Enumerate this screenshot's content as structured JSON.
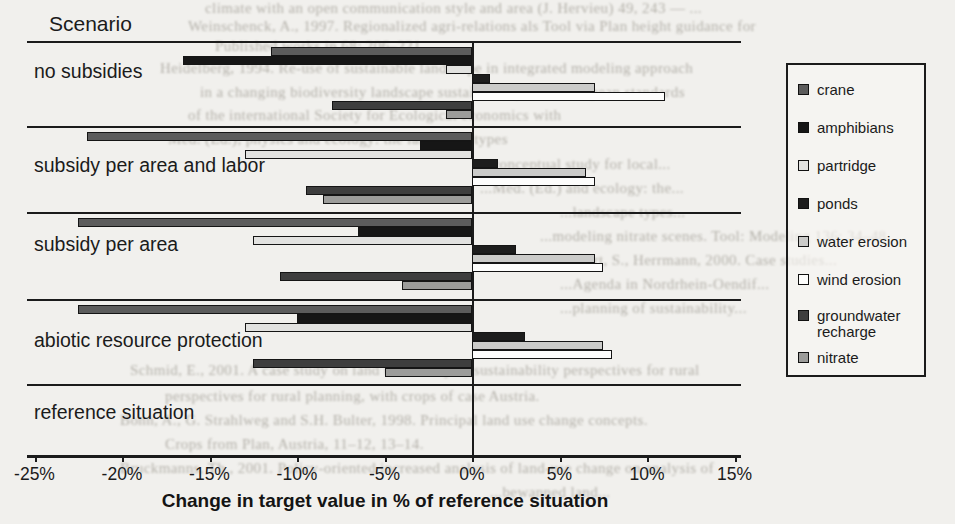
{
  "page": {
    "scenario_header": "Scenario"
  },
  "chart_data": {
    "type": "bar",
    "orientation": "horizontal",
    "title": "Scenario",
    "xlabel": "Change in target value in % of reference situation",
    "ylabel": "Scenario",
    "xlim": [
      -25,
      15
    ],
    "x_tick_labels": [
      "-25%",
      "-20%",
      "-15%",
      "-10%",
      "-5%",
      "0%",
      "5%",
      "10%",
      "15%"
    ],
    "grid": "off",
    "legend_position": "right",
    "categories": [
      "no subsidies",
      "subsidy per area and labor",
      "subsidy per area",
      "abiotic resource protection",
      "reference situation"
    ],
    "series": [
      {
        "name": "crane",
        "color": "#5c5c5c",
        "values": [
          -11.5,
          -22.0,
          -22.5,
          -22.5,
          0
        ]
      },
      {
        "name": "amphibians",
        "color": "#161616",
        "values": [
          -16.5,
          -3.0,
          -6.5,
          -10.0,
          0
        ]
      },
      {
        "name": "partridge",
        "color": "#e2e2e0",
        "values": [
          -1.5,
          -13.0,
          -12.5,
          -13.0,
          0
        ]
      },
      {
        "name": "ponds",
        "color": "#1d1d1d",
        "values": [
          1.0,
          1.5,
          2.5,
          3.0,
          0
        ]
      },
      {
        "name": "water erosion",
        "color": "#cbcbc9",
        "values": [
          7.0,
          6.5,
          7.0,
          7.5,
          0
        ]
      },
      {
        "name": "wind erosion",
        "color": "#fdfdfc",
        "values": [
          11.0,
          7.0,
          7.5,
          8.0,
          0
        ]
      },
      {
        "name": "groundwater recharge",
        "color": "#3e3e3e",
        "values": [
          -8.0,
          -9.5,
          -11.0,
          -12.5,
          0
        ]
      },
      {
        "name": "nitrate",
        "color": "#9c9c9a",
        "values": [
          -1.5,
          -8.5,
          -4.0,
          -5.0,
          0
        ]
      }
    ]
  },
  "bleed_fragments": [
    {
      "x": 205,
      "y": 0,
      "size": 15,
      "text": "climate with an open communication style and area (J. Hervieu) 49, 243 — ..."
    },
    {
      "x": 188,
      "y": 18,
      "size": 15,
      "text": "Weinschenck, A., 1997. Regionalized agri-relations als Tool via Plan height guidance for"
    },
    {
      "x": 215,
      "y": 38,
      "size": 15,
      "text": "Published works in 68: 206–221."
    },
    {
      "x": 160,
      "y": 60,
      "size": 15,
      "text": "Heidelberg, 1994. Re-use of sustainable landscape in integrated modeling approach"
    },
    {
      "x": 200,
      "y": 84,
      "size": 15,
      "text": "in a changing biodiversity landscape sustainability 16th European standards"
    },
    {
      "x": 188,
      "y": 107,
      "size": 15,
      "text": "of the international Society for Ecological economics with"
    },
    {
      "x": 168,
      "y": 131,
      "size": 15,
      "text": "Med. (Ed.), physics and ecology: the landscape types"
    },
    {
      "x": 480,
      "y": 156,
      "size": 15,
      "text": "...conceptual study for local..."
    },
    {
      "x": 480,
      "y": 180,
      "size": 15,
      "text": "...Med. (Ed.) and ecology: the..."
    },
    {
      "x": 560,
      "y": 204,
      "size": 15,
      "text": "...landscape types..."
    },
    {
      "x": 540,
      "y": 228,
      "size": 15,
      "text": "...modeling nitrate scenes. Tool: Modeling 136: 34–48."
    },
    {
      "x": 540,
      "y": 252,
      "size": 15,
      "text": "...Dabbert, S., Herrmann, 2000. Case studies..."
    },
    {
      "x": 560,
      "y": 276,
      "size": 15,
      "text": "...Agenda in Nordrhein-Oendif..."
    },
    {
      "x": 560,
      "y": 300,
      "size": 15,
      "text": "...planning of sustainability..."
    },
    {
      "x": 130,
      "y": 362,
      "size": 15,
      "text": "Schmid, E., 2001. A case study on land use library of sustainability perspectives for rural"
    },
    {
      "x": 165,
      "y": 388,
      "size": 15,
      "text": "perspectives for rural planning, with crops of case Austria."
    },
    {
      "x": 120,
      "y": 412,
      "size": 15,
      "text": "Bonn, A., G. Strahlweg and S.H. Bulter, 1998. Principal land use change concepts."
    },
    {
      "x": 165,
      "y": 436,
      "size": 15,
      "text": "Crops from Plan, Austria, 11–12, 13–14."
    },
    {
      "x": 120,
      "y": 460,
      "size": 15,
      "text": "Bruckmanns, Th., 2001. Policy-oriented increased analysis of land-use change on analysis of"
    },
    {
      "x": 490,
      "y": 484,
      "size": 15,
      "text": "...bewanned land..."
    }
  ]
}
